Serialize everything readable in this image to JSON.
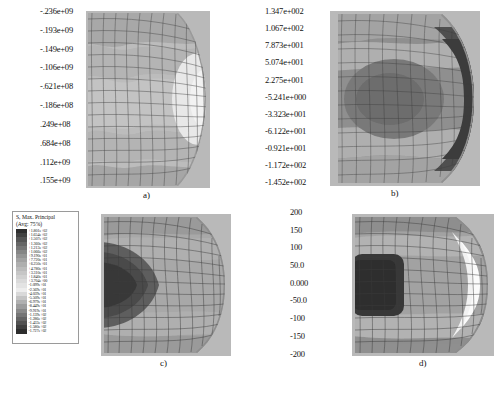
{
  "figure": {
    "type": "fem-contour-grid",
    "rows": 2,
    "cols": 2,
    "captions": [
      "a)",
      "b)",
      "c)",
      "d)"
    ]
  },
  "panels": {
    "a": {
      "caption": "a)",
      "colorbar": {
        "orientation": "vertical",
        "labels": [
          "-.236e+09",
          "-.193e+09",
          "-.149e+09",
          "-.106e+09",
          "-.621e+08",
          "-.186e+08",
          ".249e+08",
          ".684e+08",
          ".112e+09",
          ".155e+09"
        ],
        "values": [
          -2360000000.0,
          -1930000000.0,
          -1490000000.0,
          -1060000000.0,
          -621000000.0,
          -186000000.0,
          24900000.0,
          68400000.0,
          112000000.0,
          155000000.0
        ],
        "swatch_colors": [
          "#3a3a3a",
          "#8f8f8f",
          "#a8a8a8",
          "#b5b5b5",
          "#bdbdbd",
          "#c7c7c7",
          "#d8d8d8",
          "#ededed",
          "#b2b2b2",
          "#4a4a4a"
        ]
      }
    },
    "b": {
      "caption": "b)",
      "colorbar": {
        "orientation": "vertical",
        "labels": [
          "1.347e+002",
          "1.067e+002",
          "7.873e+001",
          "5.074e+001",
          "2.275e+001",
          "-5.241e+000",
          "-3.323e+001",
          "-6.122e+001",
          "-0.921e+001",
          "-1.172e+002",
          "-1.452e+002"
        ],
        "values": [
          134.7,
          106.7,
          78.73,
          50.74,
          22.75,
          -5.241,
          -33.23,
          -61.22,
          -92.1,
          -117.2,
          -145.2
        ],
        "swatch_colors": [
          "#9a9a9a",
          "#c2c2c2",
          "#dcdcdc",
          "#c0c0c0",
          "#a0a0a0",
          "#8c8c8c",
          "#7a7a7a",
          "#6a6a6a",
          "#565656",
          "#3f3f3f",
          "#2b2b2b"
        ]
      }
    },
    "c": {
      "caption": "c)",
      "legend": {
        "title_line1": "S, Max. Principal",
        "title_line2": "(Avg: 75%)",
        "labels": [
          "+1.801e+02",
          "+1.654e+02",
          "+1.507e+02",
          "+1.360e+02",
          "+1.213e+02",
          "+1.066e+02",
          "+9.190e+01",
          "+7.720e+01",
          "+6.250e+01",
          "+4.780e+01",
          "+3.310e+01",
          "+1.840e+01",
          "+3.704e+00",
          "-1.099e+01",
          "-2.569e+01",
          "-4.039e+01",
          "-5.509e+01",
          "-6.979e+01",
          "-8.449e+01",
          "-9.919e+01",
          "-1.139e+02",
          "-1.286e+02",
          "-1.433e+02",
          "-1.580e+02",
          "-1.727e+02"
        ],
        "chip_colors": [
          "#2e2e2e",
          "#414141",
          "#545454",
          "#656565",
          "#757575",
          "#858585",
          "#949494",
          "#a2a2a2",
          "#afafaf",
          "#bbbbbb",
          "#c6c6c6",
          "#d0d0d0",
          "#dadada",
          "#e3e3e3",
          "#ededed",
          "#d9d9d9",
          "#c4c4c4",
          "#b0b0b0",
          "#9c9c9c",
          "#888888",
          "#757575",
          "#636363",
          "#515151",
          "#3f3f3f",
          "#2d2d2d"
        ]
      }
    },
    "d": {
      "caption": "d)",
      "colorbar": {
        "orientation": "vertical",
        "labels": [
          "200",
          "150",
          "100",
          "50.0",
          "0.000",
          "-50.0",
          "-100",
          "-150",
          "-200"
        ],
        "values": [
          200,
          150,
          100,
          50.0,
          0.0,
          -50.0,
          -100,
          -150,
          -200
        ],
        "swatch_colors": [
          "#6f6f6f",
          "#9d9d9d",
          "#c9c9c9",
          "#efefef",
          "#b9b9b9",
          "#9c9c9c",
          "#7e7e7e",
          "#5c5c5c",
          "#3a3a3a"
        ]
      }
    }
  },
  "colors": {
    "mesh_line": "#3d3d3d",
    "background": "#ffffff",
    "band_light": "#ededed",
    "band_mid": "#b5b5b5",
    "band_dark": "#4a4a4a"
  }
}
